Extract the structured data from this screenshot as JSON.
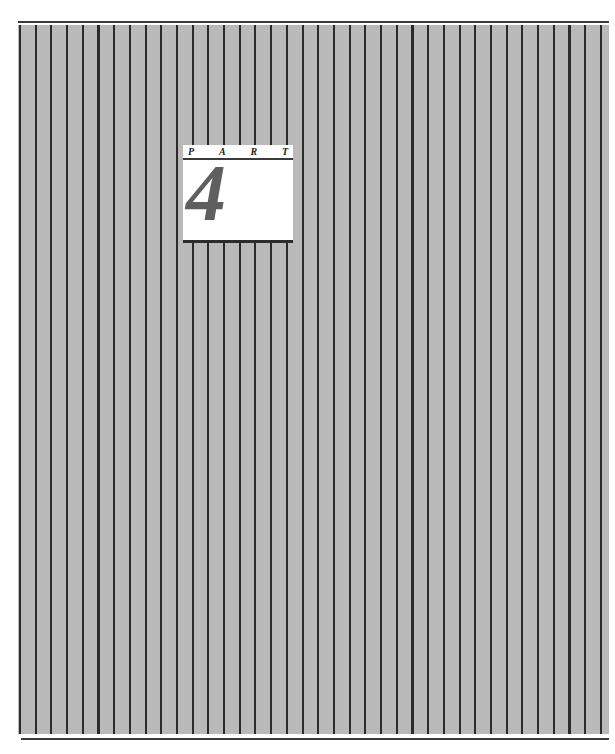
{
  "page": {
    "type": "part-divider",
    "background_color": "#b9b9b9",
    "stripe_color": "#2b2b2b"
  },
  "part_card": {
    "header_letters": [
      "P",
      "A",
      "R",
      "T"
    ],
    "number": "4",
    "number_color": "#5f5f5f"
  }
}
